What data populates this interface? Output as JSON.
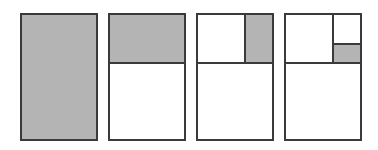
{
  "diagram": {
    "title": "",
    "colors": {
      "shade": "#b4b4b4",
      "border": "#3a3a3a",
      "background": "#ffffff"
    },
    "panels": [
      {
        "id": 1,
        "shaded": "whole rectangle"
      },
      {
        "id": 2,
        "shaded": "top half"
      },
      {
        "id": 3,
        "shaded": "right half of top half"
      },
      {
        "id": 4,
        "shaded": "bottom half of right quarter"
      }
    ]
  }
}
